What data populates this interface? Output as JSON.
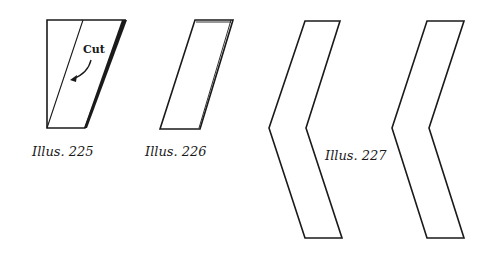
{
  "illustrations": [
    {
      "id": "225",
      "caption": "Illus. 225",
      "annotation": "Cut"
    },
    {
      "id": "226",
      "caption": "Illus. 226"
    },
    {
      "id": "227",
      "caption": "Illus. 227"
    }
  ],
  "colors": {
    "ink": "#1a1a1a",
    "paper": "#ffffff"
  }
}
